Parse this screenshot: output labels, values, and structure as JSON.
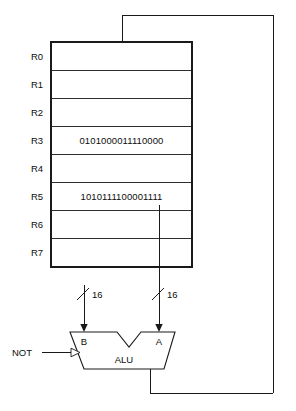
{
  "diagram": {
    "colors": {
      "ink": "#1a1a1a",
      "background": "#ffffff"
    },
    "register_file": {
      "name": "register-file",
      "registers": [
        {
          "label": "R0",
          "value": ""
        },
        {
          "label": "R1",
          "value": ""
        },
        {
          "label": "R2",
          "value": ""
        },
        {
          "label": "R3",
          "value": "0101000011110000"
        },
        {
          "label": "R4",
          "value": ""
        },
        {
          "label": "R5",
          "value": "1010111100001111"
        },
        {
          "label": "R6",
          "value": ""
        },
        {
          "label": "R7",
          "value": ""
        }
      ]
    },
    "alu": {
      "label": "ALU",
      "input_b_label": "B",
      "input_a_label": "A",
      "control_label": "NOT"
    },
    "buses": [
      {
        "name": "b-input-bus",
        "width_label": "16"
      },
      {
        "name": "a-input-bus",
        "width_label": "16"
      }
    ]
  }
}
